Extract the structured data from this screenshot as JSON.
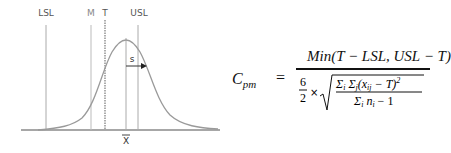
{
  "diagram": {
    "labels": {
      "lsl": "LSL",
      "m": "M",
      "t": "T",
      "usl": "USL",
      "s": "s",
      "xbar": "X"
    },
    "colors": {
      "curve": "#9a9a9a",
      "lines": "#a8a8a8",
      "axis": "#8a8a8a",
      "text": "#555555"
    }
  },
  "formula": {
    "lhs": "C",
    "lhs_sub": "pm",
    "equals": "=",
    "numerator": "Min(T − LSL, USL − T)",
    "coef_num": "6",
    "coef_den": "2",
    "times": "×",
    "inner_numerator": "Σ_i Σ_j (x_ij − T)^2",
    "inner_denominator": "Σ_i n_i − 1"
  }
}
